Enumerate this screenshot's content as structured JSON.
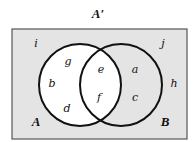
{
  "title": "A′",
  "colors": {
    "shaded": "#e4e4e4",
    "unshaded": "#ffffff",
    "stroke": "#111111",
    "border": "#555555"
  },
  "sets": {
    "A": {
      "label": "A"
    },
    "B": {
      "label": "B"
    }
  },
  "regions": {
    "outside_left_top": "i",
    "outside_right_top": "j",
    "outside_right": "h",
    "a_only_top": "g",
    "a_only_mid": "b",
    "a_only_bottom": "d",
    "intersection_top": "e",
    "intersection_bottom": "f",
    "b_only_top": "a",
    "b_only_bottom": "c"
  },
  "shading": "Complement of A shaded (B only and outside region)"
}
